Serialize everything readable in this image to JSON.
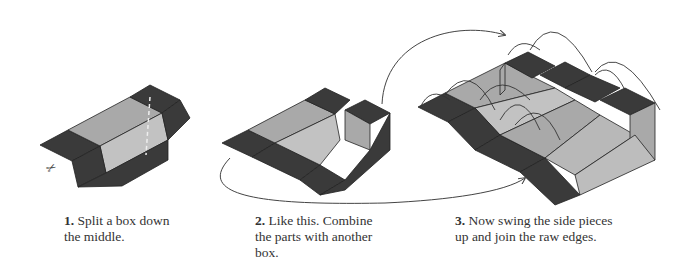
{
  "figure": {
    "type": "step-diagram",
    "colors": {
      "dark_flap": "#3a3a3a",
      "light_interior": "#a9a9a9",
      "mid_interior": "#c2c2c2",
      "line": "#222222",
      "arrow": "#444444"
    },
    "steps": [
      {
        "number": "1.",
        "text": "Split a box down the middle.",
        "icon": "scissors-icon"
      },
      {
        "number": "2.",
        "text": "Like this. Combine the parts with another box."
      },
      {
        "number": "3.",
        "text": "Now swing the side pieces up and join the raw edges."
      }
    ]
  }
}
